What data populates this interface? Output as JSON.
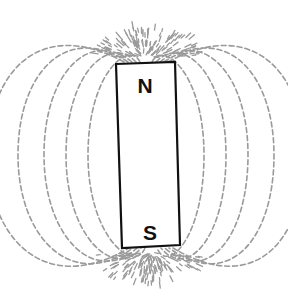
{
  "diagram": {
    "magnet": {
      "corners": [
        [
          116,
          64
        ],
        [
          175,
          62
        ],
        [
          180,
          245
        ],
        [
          122,
          248
        ]
      ],
      "fill": "#ffffff",
      "stroke": "#111111",
      "north_label": "N",
      "south_label": "S",
      "north_label_pos": [
        145,
        93
      ],
      "south_label_pos": [
        150,
        240
      ]
    },
    "field_lines": {
      "color": "#9a9a9a",
      "style": "dashed",
      "count_per_side": 5
    }
  }
}
